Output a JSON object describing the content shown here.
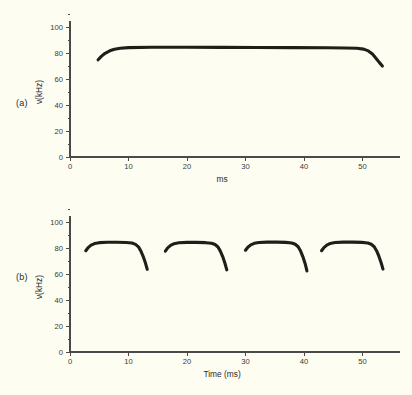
{
  "figure": {
    "background_color": "#fdfdf2",
    "trace_color": "#211d18",
    "axis_color": "#4a4a48"
  },
  "panels": [
    {
      "tag": "(a)",
      "ylabel": "ν(kHz)",
      "xlabel": "ms"
    },
    {
      "tag": "(b)",
      "ylabel": "ν(kHz)",
      "xlabel": "Time (ms)"
    }
  ],
  "chart_data": [
    {
      "type": "line",
      "title": "(a)",
      "xlabel": "ms",
      "ylabel": "ν(kHz)",
      "xlim": [
        0,
        56
      ],
      "ylim": [
        0,
        112
      ],
      "xticks": [
        0,
        10,
        20,
        30,
        40,
        50
      ],
      "xticklabels": [
        "0",
        "10",
        "20",
        "30",
        "40",
        "50"
      ],
      "yticks": [
        0,
        20,
        40,
        60,
        80,
        100
      ],
      "yticklabels": [
        "0",
        "20",
        "40",
        "60",
        "80",
        "100"
      ],
      "grid": false,
      "legend": "none",
      "series": [
        {
          "name": "single long pulse",
          "x": [
            4.8,
            5.4,
            6.0,
            6.8,
            7.6,
            8.6,
            10.0,
            14.0,
            20.0,
            26.0,
            32.0,
            38.0,
            44.0,
            47.0,
            49.0,
            50.2,
            51.0,
            51.7,
            52.3,
            52.9,
            53.4
          ],
          "y": [
            74.8,
            77.6,
            79.8,
            81.7,
            82.9,
            83.6,
            84.1,
            84.4,
            84.4,
            84.3,
            84.2,
            84.1,
            84.0,
            83.9,
            83.6,
            83.0,
            81.6,
            79.2,
            76.0,
            72.6,
            70.0
          ]
        }
      ]
    },
    {
      "type": "line",
      "title": "(b)",
      "xlabel": "Time (ms)",
      "ylabel": "ν(kHz)",
      "xlim": [
        0,
        56
      ],
      "ylim": [
        0,
        112
      ],
      "xticks": [
        0,
        10,
        20,
        30,
        40,
        50
      ],
      "xticklabels": [
        "0",
        "10",
        "20",
        "30",
        "40",
        "50"
      ],
      "yticks": [
        0,
        20,
        40,
        60,
        80,
        100
      ],
      "yticklabels": [
        "0",
        "20",
        "40",
        "60",
        "80",
        "100"
      ],
      "grid": false,
      "legend": "none",
      "series": [
        {
          "name": "pulse 1",
          "x": [
            2.7,
            3.1,
            3.6,
            4.2,
            5.0,
            6.4,
            8.0,
            9.6,
            10.6,
            11.2,
            11.7,
            12.1,
            12.5,
            12.9,
            13.2
          ],
          "y": [
            77.9,
            80.3,
            82.2,
            83.4,
            84.1,
            84.4,
            84.4,
            84.2,
            83.8,
            82.8,
            80.9,
            77.8,
            73.6,
            68.4,
            63.6
          ]
        },
        {
          "name": "pulse 2",
          "x": [
            16.3,
            16.7,
            17.2,
            17.8,
            18.6,
            20.0,
            21.6,
            23.2,
            24.2,
            24.8,
            25.3,
            25.7,
            26.1,
            26.5,
            26.8
          ],
          "y": [
            77.6,
            80.1,
            82.0,
            83.3,
            84.0,
            84.3,
            84.3,
            84.1,
            83.7,
            82.7,
            80.8,
            77.6,
            73.4,
            68.1,
            63.2
          ]
        },
        {
          "name": "pulse 3",
          "x": [
            30.0,
            30.4,
            30.9,
            31.5,
            32.3,
            33.7,
            35.3,
            36.9,
            37.9,
            38.5,
            39.0,
            39.4,
            39.8,
            40.2,
            40.5
          ],
          "y": [
            78.3,
            80.6,
            82.4,
            83.6,
            84.2,
            84.5,
            84.5,
            84.3,
            83.9,
            82.9,
            81.0,
            77.8,
            73.4,
            67.9,
            62.4
          ]
        },
        {
          "name": "pulse 4",
          "x": [
            43.0,
            43.4,
            43.9,
            44.5,
            45.3,
            46.7,
            48.3,
            49.9,
            50.9,
            51.5,
            52.0,
            52.4,
            52.8,
            53.2,
            53.5
          ],
          "y": [
            77.9,
            80.3,
            82.2,
            83.5,
            84.2,
            84.5,
            84.5,
            84.3,
            83.9,
            82.9,
            81.0,
            77.9,
            73.7,
            68.5,
            63.8
          ]
        }
      ]
    }
  ]
}
